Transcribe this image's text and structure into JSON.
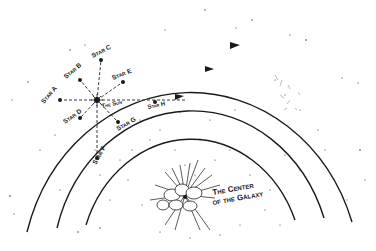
{
  "diagram": {
    "colors": {
      "ink": "#1a1a1a",
      "background": "#ffffff"
    },
    "labels": {
      "star_a": "Star A",
      "star_b": "Star B",
      "star_c": "Star C",
      "star_d": "Star D",
      "star_e": "Star E",
      "star_f": "Star F",
      "star_g": "Star G",
      "star_h": "Star H",
      "sun": "The Sun",
      "center_line1": "The Center",
      "center_line2": "of the Galaxy"
    },
    "orbits": [
      {
        "name": "outer-orbit",
        "stars": [
          "Star A",
          "Star B",
          "Star C"
        ]
      },
      {
        "name": "middle-orbit",
        "stars": [
          "Star D",
          "The Sun",
          "Star E"
        ]
      },
      {
        "name": "inner-orbit",
        "stars": [
          "Star F",
          "Star G",
          "Star H"
        ]
      }
    ]
  }
}
